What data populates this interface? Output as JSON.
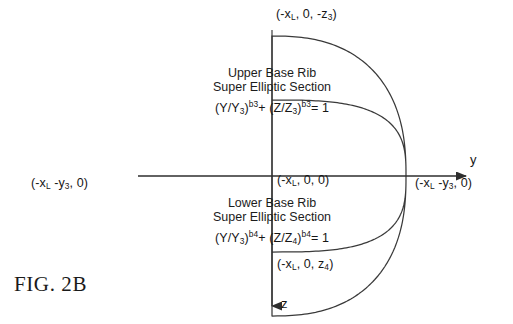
{
  "figure": {
    "caption": "FIG. 2B",
    "background_color": "#ffffff",
    "line_color": "#3a3a3a",
    "text_color": "#161616"
  },
  "axes": {
    "horizontal_label": "y",
    "vertical_label": "z",
    "origin_label_prefix": "(-x",
    "origin_label": "(-x_L, 0, 0)"
  },
  "labels": {
    "top_point": {
      "open": "(-x",
      "sub1": "L",
      "mid": ", 0, -z",
      "sub2": "3",
      "close": ")"
    },
    "bottom_point": {
      "open": "(-x",
      "sub1": "L",
      "mid": ", 0, z",
      "sub2": "4",
      "close": ")"
    },
    "left_point": {
      "open": "(-x",
      "sub1": "L",
      "mid": " -y",
      "sub2": "3",
      "close": ", 0)"
    },
    "right_point": {
      "open": "(-x",
      "sub1": "L",
      "mid": " -y",
      "sub2": "3",
      "close": ", 0)"
    },
    "origin_point": {
      "open": "(-x",
      "sub1": "L",
      "close": ", 0, 0)"
    }
  },
  "upper_section": {
    "title_line1": "Upper Base Rib",
    "title_line2": "Super Elliptic Section",
    "equation": {
      "t1_open": "(Y/Y",
      "t1_sub": "3",
      "t1_close": ")",
      "t1_exp": "b3",
      "plus": "+ (Z/Z",
      "t2_sub": "3",
      "t2_close": ")",
      "t2_exp": "b3",
      "tail": "= 1"
    }
  },
  "lower_section": {
    "title_line1": "Lower Base Rib",
    "title_line2": "Super Elliptic Section",
    "equation": {
      "t1_open": "(Y/Y",
      "t1_sub": "3",
      "t1_close": ")",
      "t1_exp": "b4",
      "plus": "+ (Z/Z",
      "t2_sub": "4",
      "t2_close": ")",
      "t2_exp": "b4",
      "tail": "= 1"
    }
  },
  "geometry": {
    "center_x": 272,
    "center_y": 176,
    "half_width": 134,
    "upper_height": 140,
    "lower_height": 76,
    "upper_exponent": 2.45,
    "lower_exponent": 3.1
  }
}
